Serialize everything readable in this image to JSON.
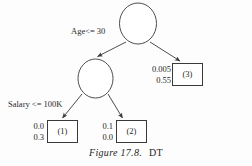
{
  "figure": {
    "caption_label": "Figure 17.8.",
    "caption_title": "DT",
    "background_color": "#fdfdfd",
    "stroke_color": "#3a3a3a",
    "text_color": "#262626"
  },
  "tree": {
    "nodes": [
      {
        "id": "root",
        "type": "decision",
        "shape": "ellipse",
        "label": ""
      },
      {
        "id": "inner",
        "type": "decision",
        "shape": "ellipse",
        "label": ""
      }
    ],
    "edge_labels": {
      "root_left": "Age<= 30",
      "inner_left": "Salary <= 100K"
    },
    "leaves": [
      {
        "id": "leaf1",
        "box_label": "(1)",
        "values": [
          "0.0",
          "0.3"
        ]
      },
      {
        "id": "leaf2",
        "box_label": "(2)",
        "values": [
          "0.1",
          "0.0"
        ]
      },
      {
        "id": "leaf3",
        "box_label": "(3)",
        "values": [
          "0.005",
          "0.55"
        ]
      }
    ]
  }
}
